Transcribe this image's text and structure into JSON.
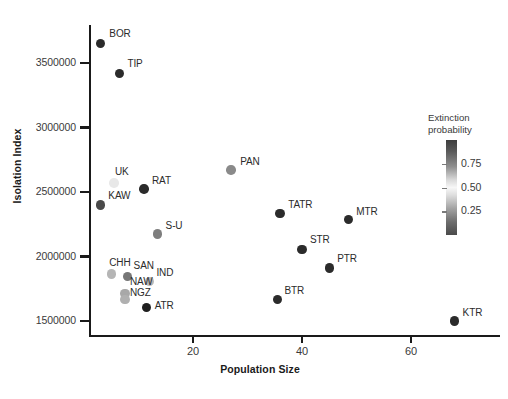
{
  "chart_data": {
    "type": "scatter",
    "title": "",
    "xlabel": "Population Size",
    "ylabel": "Isolation Index",
    "xlim": [
      0,
      75
    ],
    "ylim": [
      1400000,
      3800000
    ],
    "grid": false,
    "xticks": [
      20,
      40,
      60
    ],
    "xtick_labels": [
      "20",
      "40",
      "60"
    ],
    "yticks": [
      1500000,
      2000000,
      2500000,
      3000000,
      3500000
    ],
    "ytick_labels": [
      "1500000",
      "2000000",
      "2500000",
      "3000000",
      "3500000"
    ],
    "colorbar": {
      "title_line1": "Extinction",
      "title_line2": "probability",
      "ticks": [
        0.75,
        0.5,
        0.25
      ],
      "tick_labels": [
        "0.75",
        "0.50",
        "0.25"
      ],
      "position": "right",
      "orientation": "vertical",
      "colormap": "grey-diverging",
      "high_color": "#3d3d3d",
      "mid_color": "#f7f7f7",
      "low_color": "#4a4a4a"
    },
    "points": [
      {
        "label": "BOR",
        "x": 3.0,
        "y": 3650000,
        "value": 0.92,
        "color": "#2b2b2b",
        "lx": 9,
        "ly": -16
      },
      {
        "label": "TIP",
        "x": 6.5,
        "y": 3420000,
        "value": 0.9,
        "color": "#2b2b2b",
        "lx": 8,
        "ly": -15
      },
      {
        "label": "UK",
        "x": 5.5,
        "y": 2570000,
        "value": 0.5,
        "color": "#e8e8e8",
        "lx": 1,
        "ly": -17
      },
      {
        "label": "RAT",
        "x": 11.0,
        "y": 2525000,
        "value": 0.88,
        "color": "#2b2b2b",
        "lx": 8,
        "ly": -14
      },
      {
        "label": "KAW",
        "x": 3.0,
        "y": 2400000,
        "value": 0.78,
        "color": "#4a4a4a",
        "lx": 8,
        "ly": -15
      },
      {
        "label": "PAN",
        "x": 27.0,
        "y": 2670000,
        "value": 0.62,
        "color": "#8a8a8a",
        "lx": 9,
        "ly": -14
      },
      {
        "label": "S-U",
        "x": 13.5,
        "y": 2175000,
        "value": 0.66,
        "color": "#7e7e7e",
        "lx": 8,
        "ly": -14
      },
      {
        "label": "TATR",
        "x": 36.0,
        "y": 2335000,
        "value": 0.92,
        "color": "#2b2b2b",
        "lx": 8,
        "ly": -14
      },
      {
        "label": "MTR",
        "x": 48.5,
        "y": 2285000,
        "value": 0.92,
        "color": "#2b2b2b",
        "lx": 8,
        "ly": -14
      },
      {
        "label": "STR",
        "x": 40.0,
        "y": 2055000,
        "value": 0.92,
        "color": "#2b2b2b",
        "lx": 8,
        "ly": -15
      },
      {
        "label": "PTR",
        "x": 45.0,
        "y": 1910000,
        "value": 0.92,
        "color": "#2b2b2b",
        "lx": 8,
        "ly": -15
      },
      {
        "label": "CHH",
        "x": 5.0,
        "y": 1865000,
        "value": 0.4,
        "color": "#b5b5b5",
        "lx": -2,
        "ly": -17
      },
      {
        "label": "SAN",
        "x": 8.0,
        "y": 1845000,
        "value": 0.7,
        "color": "#767676",
        "lx": 6,
        "ly": -16
      },
      {
        "label": "IND",
        "x": 12.0,
        "y": 1805000,
        "value": 0.4,
        "color": "#b8b8b8",
        "lx": 7,
        "ly": -15
      },
      {
        "label": "NAW",
        "x": 7.5,
        "y": 1715000,
        "value": 0.45,
        "color": "#a8a8a8",
        "lx": 5,
        "ly": -17
      },
      {
        "label": "NGZ",
        "x": 7.5,
        "y": 1665000,
        "value": 0.42,
        "color": "#b0b0b0",
        "lx": 5,
        "ly": -13
      },
      {
        "label": "ATR",
        "x": 11.5,
        "y": 1605000,
        "value": 0.93,
        "color": "#1f1f1f",
        "lx": 8,
        "ly": -7
      },
      {
        "label": "BTR",
        "x": 35.5,
        "y": 1665000,
        "value": 0.93,
        "color": "#2b2b2b",
        "lx": 7,
        "ly": -15
      },
      {
        "label": "KTR",
        "x": 68.0,
        "y": 1500000,
        "value": 0.93,
        "color": "#2b2b2b",
        "lx": 8,
        "ly": -14
      }
    ]
  }
}
